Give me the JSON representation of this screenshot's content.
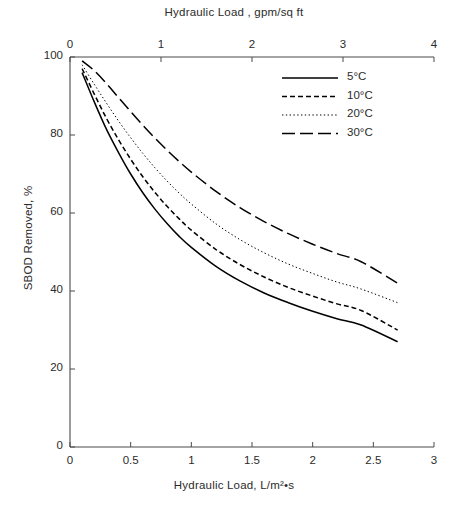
{
  "chart_data": {
    "type": "line",
    "title": "",
    "xlabel": "Hydraulic Load, L/m²•s",
    "xlabel_top": "Hydraulic Load , gpm/sq ft",
    "ylabel": "SBOD Removed, %",
    "xlim": [
      0,
      3
    ],
    "xlim_top": [
      0,
      4
    ],
    "ylim": [
      0,
      100
    ],
    "xticks": [
      0,
      0.5,
      1,
      1.5,
      2,
      2.5,
      3
    ],
    "xticklabels": [
      "0",
      "0.5",
      "1",
      "1.5",
      "2",
      "2.5",
      "3"
    ],
    "xticks_top": [
      0,
      1,
      2,
      3,
      4
    ],
    "xticklabels_top": [
      "0",
      "1",
      "2",
      "3",
      "4"
    ],
    "yticks": [
      0,
      20,
      40,
      60,
      80,
      100
    ],
    "yticklabels": [
      "0",
      "20",
      "40",
      "60",
      "80",
      "100"
    ],
    "grid": false,
    "legend_position": "top-right",
    "x": [
      0.1,
      0.2,
      0.3,
      0.4,
      0.5,
      0.6,
      0.7,
      0.8,
      0.9,
      1.0,
      1.2,
      1.4,
      1.6,
      1.8,
      2.0,
      2.2,
      2.4,
      2.7
    ],
    "series": [
      {
        "name": "5°C",
        "style": "solid",
        "values": [
          96.0,
          88.5,
          81.5,
          75.5,
          70.0,
          65.2,
          61.0,
          57.3,
          54.0,
          51.2,
          46.4,
          42.6,
          39.5,
          37.0,
          34.8,
          32.9,
          31.3,
          27.0
        ]
      },
      {
        "name": "10°C",
        "style": "dashed",
        "values": [
          97.0,
          90.5,
          84.3,
          78.8,
          73.8,
          69.3,
          65.3,
          61.7,
          58.5,
          55.6,
          50.7,
          46.8,
          43.6,
          40.9,
          38.7,
          36.7,
          35.0,
          30.0
        ]
      },
      {
        "name": "20°C",
        "style": "dotted",
        "values": [
          98.0,
          93.0,
          88.2,
          83.6,
          79.3,
          75.3,
          71.6,
          68.2,
          65.1,
          62.3,
          57.3,
          53.2,
          49.8,
          46.9,
          44.5,
          42.3,
          40.5,
          37.0
        ]
      },
      {
        "name": "30°C",
        "style": "longdash",
        "values": [
          99.0,
          96.5,
          93.2,
          89.6,
          86.0,
          82.5,
          79.2,
          76.1,
          73.2,
          70.5,
          65.6,
          61.4,
          57.8,
          54.7,
          52.0,
          49.6,
          47.5,
          42.0
        ]
      }
    ]
  },
  "axes": {
    "top_title": "Hydraulic Load , gpm/sq ft",
    "bottom_title": "Hydraulic Load, L/m²•s",
    "y_title": "SBOD Removed, %"
  },
  "legend": {
    "entries": [
      {
        "label": "5°C",
        "style": "solid"
      },
      {
        "label": "10°C",
        "style": "dashed"
      },
      {
        "label": "20°C",
        "style": "dotted"
      },
      {
        "label": "30°C",
        "style": "longdash"
      }
    ]
  },
  "colors": {
    "line": "#000000",
    "axis": "#4a4a4a",
    "text": "#2b2b2b",
    "background": "#ffffff"
  }
}
